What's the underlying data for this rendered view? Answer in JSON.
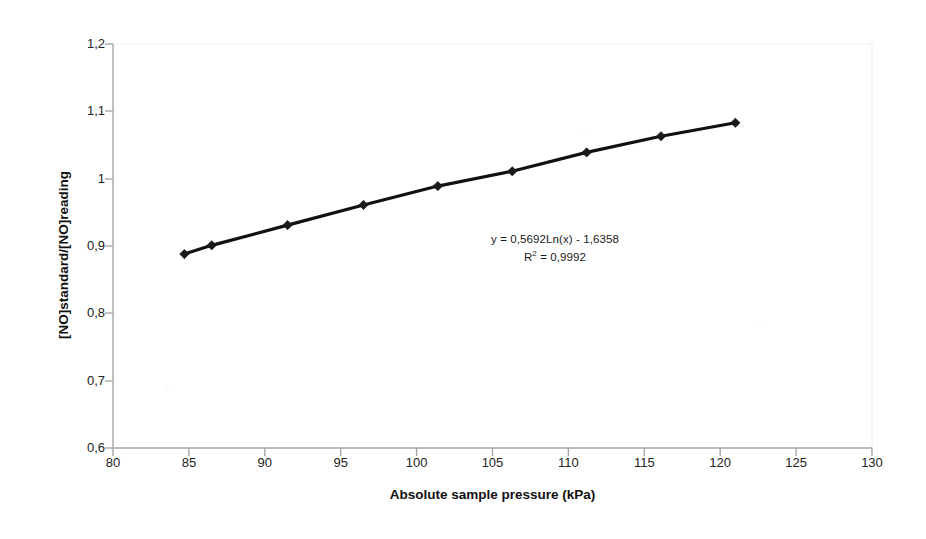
{
  "chart_data": {
    "type": "line",
    "title": "",
    "subtitle": "",
    "xlabel": "Absolute sample pressure (kPa)",
    "ylabel": "[NO]standard/[NO]reading",
    "xlim": [
      80,
      130
    ],
    "ylim": [
      0.6,
      1.2
    ],
    "xticks": [
      80,
      85,
      90,
      95,
      100,
      105,
      110,
      115,
      120,
      125,
      130
    ],
    "xtick_labels": [
      "80",
      "85",
      "90",
      "95",
      "100",
      "105",
      "110",
      "115",
      "120",
      "125",
      "130"
    ],
    "yticks": [
      0.6,
      0.7,
      0.8,
      0.9,
      1.0,
      1.1,
      1.2
    ],
    "ytick_labels": [
      "0,6",
      "0,7",
      "0,8",
      "0,9",
      "1",
      "1,1",
      "1,2"
    ],
    "grid": false,
    "legend": false,
    "legend_position": "none",
    "decimal_separator": ",",
    "marker": "diamond",
    "line_color": "#111111",
    "marker_color": "#1a1a1a",
    "axis_color": "#9a9a9a",
    "plot_border_color": "#e2e2e2",
    "background_color": "#ffffff",
    "x": [
      84.7,
      86.5,
      91.5,
      96.5,
      101.4,
      106.3,
      111.2,
      116.1,
      121.0
    ],
    "y": [
      0.888,
      0.901,
      0.931,
      0.961,
      0.989,
      1.011,
      1.039,
      1.063,
      1.083
    ],
    "series": [
      {
        "name": "[NO]standard/[NO]reading vs pressure",
        "x": [
          84.7,
          86.5,
          91.5,
          96.5,
          101.4,
          106.3,
          111.2,
          116.1,
          121.0
        ],
        "values": [
          0.888,
          0.901,
          0.931,
          0.961,
          0.989,
          1.011,
          1.039,
          1.063,
          1.083
        ]
      }
    ],
    "annotations": [
      {
        "text": "y = 0,5692Ln(x) - 1,6358",
        "x": 104,
        "y": 0.845
      },
      {
        "text": "R² = 0,9992",
        "x": 104,
        "y": 0.823
      }
    ],
    "trendline": {
      "type": "logarithmic",
      "equation": "y = 0,5692Ln(x) - 1,6358",
      "slope": 0.5692,
      "intercept": -1.6358,
      "r_squared_label": "R",
      "r_squared_exponent": "2",
      "r_squared_equals": "= 0,9992",
      "r_squared": 0.9992
    }
  },
  "axes": {
    "x_title": "Absolute sample pressure (kPa)",
    "y_title": "[NO]standard/[NO]reading"
  },
  "annotation": {
    "equation": "y = 0,5692Ln(x) - 1,6358",
    "r_prefix": "R",
    "r_exponent": "2",
    "r_value": " = 0,9992"
  }
}
